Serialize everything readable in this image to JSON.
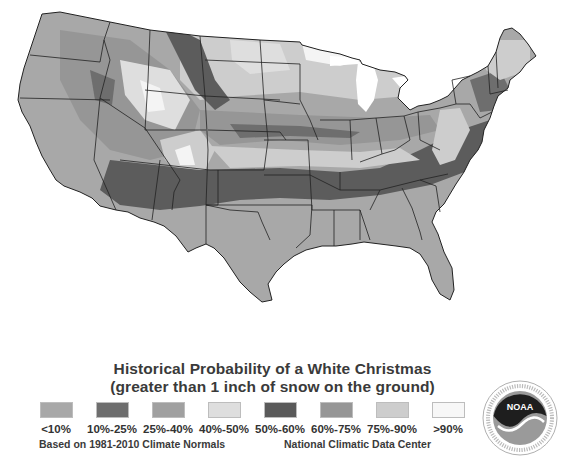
{
  "title": {
    "line1": "Historical Probability of a White Christmas",
    "line2": "(greater than 1 inch of snow on the ground)"
  },
  "legend": {
    "items": [
      {
        "label": "<10%",
        "color": "#a8a8a8"
      },
      {
        "label": "10%-25%",
        "color": "#6e6e6e"
      },
      {
        "label": "25%-40%",
        "color": "#a0a0a0"
      },
      {
        "label": "40%-50%",
        "color": "#dedede"
      },
      {
        "label": "50%-60%",
        "color": "#5a5a5a"
      },
      {
        "label": "60%-75%",
        "color": "#969696"
      },
      {
        "label": "75%-90%",
        "color": "#cdcdcd"
      },
      {
        "label": ">90%",
        "color": "#f7f7f7"
      }
    ]
  },
  "footnotes": {
    "left": "Based on 1981-2010 Climate Normals",
    "right": "National Climatic Data Center"
  },
  "logo": {
    "text": "NOAA",
    "ring_text": "NATIONAL OCEANIC AND ATMOSPHERIC ADMINISTRATION · U.S. DEPARTMENT OF COMMERCE"
  },
  "map": {
    "region": "Contiguous United States",
    "colors": {
      "land_base": "#a8a8a8",
      "band_dark": "#6e6e6e",
      "band_darker": "#5c5c5c",
      "band_mid": "#969696",
      "band_light": "#cdcdcd",
      "band_lighter": "#dedede",
      "band_white": "#f4f4f4",
      "border": "#222222",
      "water": "#ffffff"
    }
  }
}
